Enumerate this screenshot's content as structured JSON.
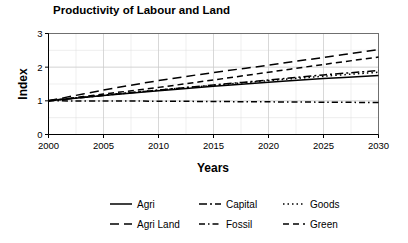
{
  "chart_data": {
    "type": "line",
    "title": "Productivity of Labour and Land",
    "xlabel": "Years",
    "ylabel": "Index",
    "xlim": [
      2000,
      2030
    ],
    "ylim": [
      0,
      3
    ],
    "grid": true,
    "legend_position": "bottom",
    "legend_columns": 3,
    "xticks": [
      2000,
      2005,
      2010,
      2015,
      2020,
      2025,
      2030
    ],
    "xtick_labels": [
      "2000",
      "2005",
      "2010",
      "2015",
      "2020",
      "2025",
      "2030"
    ],
    "yticks": [
      0,
      1,
      2,
      3
    ],
    "ytick_labels": [
      "0",
      "1",
      "2",
      "3"
    ],
    "x": [
      2000,
      2005,
      2010,
      2015,
      2020,
      2025,
      2030
    ],
    "series": [
      {
        "name": "Agri",
        "dash": "solid",
        "dasharray": "none",
        "color": "#000000",
        "values": [
          1.0,
          1.16,
          1.3,
          1.43,
          1.55,
          1.66,
          1.75
        ]
      },
      {
        "name": "Agri Land",
        "dash": "long-dash",
        "dasharray": "9,5",
        "color": "#000000",
        "values": [
          1.0,
          1.32,
          1.6,
          1.84,
          2.06,
          2.29,
          2.52
        ]
      },
      {
        "name": "Capital",
        "dash": "dash-dot",
        "dasharray": "8,3,2,3",
        "color": "#000000",
        "values": [
          1.0,
          1.16,
          1.32,
          1.47,
          1.62,
          1.77,
          1.9
        ]
      },
      {
        "name": "Fossil",
        "dash": "dot-dash",
        "dasharray": "6,3,1.5,3",
        "color": "#000000",
        "values": [
          1.0,
          0.995,
          0.99,
          0.98,
          0.97,
          0.96,
          0.95
        ]
      },
      {
        "name": "Goods",
        "dash": "dotted",
        "dasharray": "1.5,3",
        "color": "#000000",
        "values": [
          1.0,
          1.17,
          1.32,
          1.46,
          1.6,
          1.73,
          1.85
        ]
      },
      {
        "name": "Green",
        "dash": "dash",
        "dasharray": "6,4",
        "color": "#000000",
        "values": [
          1.0,
          1.2,
          1.4,
          1.62,
          1.85,
          2.08,
          2.3
        ]
      }
    ],
    "legend_entries": [
      {
        "label": "Agri",
        "dasharray": "none"
      },
      {
        "label": "Capital",
        "dasharray": "8,3,2,3"
      },
      {
        "label": "Goods",
        "dasharray": "1.5,3"
      },
      {
        "label": "Agri Land",
        "dasharray": "9,5"
      },
      {
        "label": "Fossil",
        "dasharray": "6,3,1.5,3"
      },
      {
        "label": "Green",
        "dasharray": "6,4"
      }
    ]
  }
}
